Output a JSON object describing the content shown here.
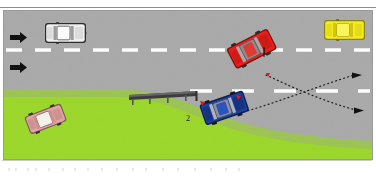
{
  "figure": {
    "frame": {
      "x": 3,
      "y": 10,
      "width": 370,
      "height": 150
    }
  },
  "colors": {
    "road": "#a8a8a8",
    "road_shadow": "#9d9d9d",
    "grass": "#9bd72a",
    "lane_marking": "#ffffff",
    "car_red": "#e8201c",
    "car_blue": "#1b3f9c",
    "car_yellow": "#f2e718",
    "car_white": "#f2f2f2",
    "car_pink": "#e0a0a0",
    "guardrail": "#4a4a4a",
    "trajectory": "#1a1a1a",
    "frame_border": "#9a9a9a",
    "marker_red": "#d81b1b"
  },
  "road": {
    "surface_label": "asphalt-carriageway",
    "shoulder_label": "grass-verge",
    "centre_line": {
      "name": "dashed-centre-line",
      "style": "dashed",
      "y": 49,
      "dash_count": 13
    },
    "edge_line": {
      "name": "dashed-edge-line",
      "style": "dashed",
      "y": 90,
      "dash_count": 5
    }
  },
  "direction_arrows": [
    {
      "name": "direction-arrow-upper",
      "label": "",
      "x": 12,
      "y": 30,
      "points": "right"
    },
    {
      "name": "direction-arrow-lower",
      "label": "",
      "x": 12,
      "y": 62,
      "points": "right"
    }
  ],
  "vehicles": [
    {
      "id": "white-car",
      "name": "vehicle-white-sedan",
      "color": "#f2f2f2",
      "label": "",
      "x": 44,
      "y": 22,
      "width": 40,
      "height": 20,
      "rotation": 0,
      "description": "White sedan travelling right in the upper lane"
    },
    {
      "id": "yellow-car",
      "name": "vehicle-yellow-sedan",
      "color": "#f2e718",
      "label": "",
      "x": 325,
      "y": 18,
      "width": 40,
      "height": 20,
      "rotation": 0,
      "description": "Yellow sedan in the far upper lane"
    },
    {
      "id": "red-car-1",
      "name": "vehicle-red-sedan-1",
      "color": "#e8201c",
      "label": "1",
      "label_x": 265,
      "label_y": 48,
      "x": 224,
      "y": 48,
      "width": 46,
      "height": 23,
      "rotation": -28,
      "description": "Red sedan number 1, rotated, post-impact rest position"
    },
    {
      "id": "blue-car-2",
      "name": "vehicle-blue-sedan-2",
      "color": "#1b3f9c",
      "label": "2",
      "label_x": 186,
      "label_y": 118,
      "x": 198,
      "y": 104,
      "width": 46,
      "height": 22,
      "rotation": -20,
      "description": "Blue sedan number 2, rotated, post-impact rest position"
    },
    {
      "id": "pink-car",
      "name": "vehicle-pink-sedan",
      "color": "#e0a0a0",
      "label": "",
      "x": 22,
      "y": 116,
      "width": 38,
      "height": 19,
      "rotation": -22,
      "description": "Pink/red sedan parked on the lower verge"
    }
  ],
  "guardrail": {
    "name": "guardrail-barrier",
    "label": "",
    "x1": 128,
    "y1": 92,
    "x2": 196,
    "y2": 92,
    "post_count": 4
  },
  "trajectories": [
    {
      "name": "trajectory-vehicle-1",
      "label": "",
      "style": "dotted",
      "from_vehicle": "red-car-1",
      "points": [
        [
          268,
          72
        ],
        [
          300,
          86
        ],
        [
          330,
          99
        ],
        [
          360,
          108
        ]
      ],
      "arrowhead": "right"
    },
    {
      "name": "trajectory-vehicle-2",
      "label": "",
      "style": "dotted",
      "from_vehicle": "blue-car-2",
      "points": [
        [
          242,
          108
        ],
        [
          280,
          94
        ],
        [
          320,
          80
        ],
        [
          358,
          72
        ]
      ],
      "arrowhead": "right"
    }
  ],
  "impact_markers": [
    {
      "name": "impact-marker-a",
      "x": 229,
      "y": 47
    },
    {
      "name": "impact-marker-b",
      "x": 266,
      "y": 74
    },
    {
      "name": "impact-marker-c",
      "x": 201,
      "y": 103
    },
    {
      "name": "impact-marker-d",
      "x": 237,
      "y": 99
    }
  ],
  "labels": {
    "vehicle_one": "1",
    "vehicle_two": "2"
  }
}
